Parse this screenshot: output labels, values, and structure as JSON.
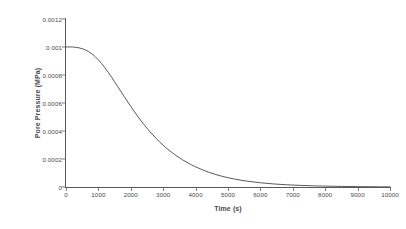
{
  "chart_data": {
    "type": "line",
    "title": "",
    "xlabel": "Time (s)",
    "ylabel": "Pore Pressure (MPa)",
    "xlim": [
      0,
      10000
    ],
    "ylim": [
      0,
      0.0012
    ],
    "grid": false,
    "legend": false,
    "legend_position": "none",
    "line_color": "#595959",
    "axis_color": "#595959",
    "background_color": "#ffffff",
    "xticks": [
      0,
      1000,
      2000,
      3000,
      4000,
      5000,
      6000,
      7000,
      8000,
      9000,
      10000
    ],
    "xtick_labels": [
      "0",
      "1000",
      "2000",
      "3000",
      "4000",
      "5000",
      "6000",
      "7000",
      "8000",
      "9000",
      "10000"
    ],
    "yticks": [
      0,
      0.0002,
      0.0004,
      0.0006,
      0.0008,
      0.001,
      0.0012
    ],
    "ytick_labels": [
      "0",
      "0.0002",
      "0.0004",
      "0.0006",
      "0.0008",
      "0.001",
      "0.0012"
    ],
    "series": [
      {
        "name": "Pore Pressure",
        "x": [
          0,
          200,
          400,
          600,
          800,
          1000,
          1200,
          1400,
          1600,
          1800,
          2000,
          2200,
          2400,
          2600,
          2800,
          3000,
          3200,
          3400,
          3600,
          3800,
          4000,
          4400,
          4800,
          5200,
          5600,
          6000,
          6400,
          6800,
          7200,
          7600,
          8000,
          8500,
          9000,
          9500,
          10000
        ],
        "y": [
          0.001,
          0.001,
          0.000994,
          0.000979,
          0.000951,
          0.000908,
          0.000852,
          0.000787,
          0.000716,
          0.000645,
          0.000575,
          0.000509,
          0.000448,
          0.000393,
          0.000343,
          0.000298,
          0.000259,
          0.000224,
          0.000194,
          0.000167,
          0.000144,
          0.000106,
          7.76e-05,
          5.68e-05,
          4.15e-05,
          3.03e-05,
          2.21e-05,
          1.61e-05,
          1.18e-05,
          8.6e-06,
          6.3e-06,
          4.1e-06,
          2.7e-06,
          1.7e-06,
          1.1e-06
        ]
      }
    ]
  }
}
